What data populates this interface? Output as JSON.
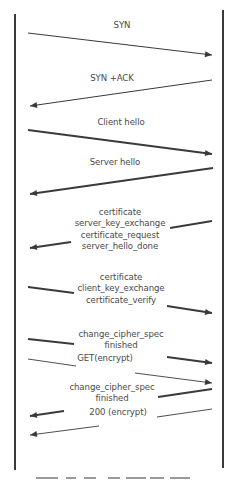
{
  "diagram": {
    "participants": [
      {
        "name": "client",
        "x": 15,
        "y1": 14,
        "y2": 470
      },
      {
        "name": "server",
        "x": 223,
        "y1": 10,
        "y2": 468
      }
    ],
    "line_color": "#3a3a3a",
    "label_color": "#4a4a4a",
    "messages": [
      {
        "id": "syn",
        "direction": "client-to-server",
        "label": [
          "SYN"
        ],
        "label_x": 122,
        "label_y": 28,
        "segments": [
          {
            "x1": 28,
            "y1": 33,
            "x2": 212,
            "y2": 55,
            "w": 1,
            "arrow": true
          }
        ]
      },
      {
        "id": "syn-ack",
        "direction": "server-to-client",
        "label": [
          "SYN +ACK"
        ],
        "label_x": 112,
        "label_y": 81,
        "segments": [
          {
            "x1": 212,
            "y1": 80,
            "x2": 30,
            "y2": 106,
            "w": 1,
            "arrow": true
          }
        ]
      },
      {
        "id": "client-hello",
        "direction": "client-to-server",
        "label": [
          "Client hello"
        ],
        "label_x": 121,
        "label_y": 125,
        "segments": [
          {
            "x1": 28,
            "y1": 130,
            "x2": 212,
            "y2": 154,
            "w": 1.8,
            "arrow": true
          }
        ]
      },
      {
        "id": "server-hello",
        "direction": "server-to-client",
        "label": [
          "Server hello"
        ],
        "label_x": 115,
        "label_y": 165,
        "segments": [
          {
            "x1": 213,
            "y1": 168,
            "x2": 30,
            "y2": 194,
            "w": 1.8,
            "arrow": true
          }
        ]
      },
      {
        "id": "server-certificate-block",
        "direction": "server-to-client",
        "label": [
          "certificate",
          "server_key_exchange",
          "certificate_request",
          "server_hello_done"
        ],
        "label_x": 120,
        "label_y": 215,
        "segments": [
          {
            "x1": 212,
            "y1": 221,
            "x2": 170,
            "y2": 228,
            "w": 1.8,
            "arrow": false
          },
          {
            "x1": 71,
            "y1": 242,
            "x2": 30,
            "y2": 248,
            "w": 1.8,
            "arrow": true
          }
        ]
      },
      {
        "id": "client-certificate-block",
        "direction": "client-to-server",
        "label": [
          "certificate",
          "client_key_exchange",
          "certificate_verify"
        ],
        "label_x": 121,
        "label_y": 280,
        "segments": [
          {
            "x1": 28,
            "y1": 287,
            "x2": 74,
            "y2": 293,
            "w": 1.8,
            "arrow": false
          },
          {
            "x1": 167,
            "y1": 306,
            "x2": 212,
            "y2": 313,
            "w": 1.8,
            "arrow": true
          }
        ]
      },
      {
        "id": "client-change-cipher",
        "direction": "client-to-server",
        "label": [
          "change_cipher_spec",
          "finished"
        ],
        "label_x": 121,
        "label_y": 337,
        "segments": [
          {
            "x1": 28,
            "y1": 339,
            "x2": 74,
            "y2": 344,
            "w": 1.8,
            "arrow": false
          },
          {
            "x1": 167,
            "y1": 357,
            "x2": 212,
            "y2": 363,
            "w": 1.8,
            "arrow": true
          }
        ]
      },
      {
        "id": "get-request",
        "direction": "client-to-server",
        "label": [
          "GET(encrypt)"
        ],
        "label_x": 105,
        "label_y": 361,
        "segments": [
          {
            "x1": 28,
            "y1": 359,
            "x2": 76,
            "y2": 366,
            "w": 0.9,
            "arrow": false
          },
          {
            "x1": 135,
            "y1": 373,
            "x2": 212,
            "y2": 383,
            "w": 0.9,
            "arrow": true
          }
        ]
      },
      {
        "id": "server-change-cipher",
        "direction": "server-to-client",
        "label": [
          "change_cipher_spec",
          "finished"
        ],
        "label_x": 112,
        "label_y": 390,
        "segments": [
          {
            "x1": 212,
            "y1": 389,
            "x2": 158,
            "y2": 397,
            "w": 1.8,
            "arrow": false
          },
          {
            "x1": 64,
            "y1": 411,
            "x2": 30,
            "y2": 416,
            "w": 1.8,
            "arrow": true
          }
        ]
      },
      {
        "id": "response-200",
        "direction": "server-to-client",
        "label": [
          "200  (encrypt)"
        ],
        "label_x": 118,
        "label_y": 415,
        "segments": [
          {
            "x1": 212,
            "y1": 409,
            "x2": 157,
            "y2": 417,
            "w": 0.9,
            "arrow": false
          },
          {
            "x1": 99,
            "y1": 426,
            "x2": 30,
            "y2": 435,
            "w": 0.9,
            "arrow": true
          }
        ]
      }
    ],
    "caption_fragments": [
      {
        "x": 36,
        "w": 22
      },
      {
        "x": 66,
        "w": 10
      },
      {
        "x": 84,
        "w": 12
      },
      {
        "x": 108,
        "w": 12
      },
      {
        "x": 126,
        "w": 20
      },
      {
        "x": 150,
        "w": 14
      },
      {
        "x": 170,
        "w": 20
      }
    ]
  }
}
